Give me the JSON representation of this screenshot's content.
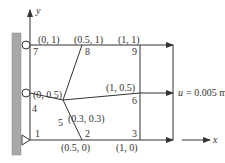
{
  "axes": {
    "y_label": "y",
    "x_label": "x"
  },
  "load": {
    "text": "u = 0.005 m",
    "var": "u",
    "value": "= 0.005 m"
  },
  "nodes": [
    {
      "id": "1",
      "coord": ""
    },
    {
      "id": "2",
      "coord": "(0.5, 0)"
    },
    {
      "id": "3",
      "coord": "(1, 0)"
    },
    {
      "id": "4",
      "coord": "(0, 0.5)"
    },
    {
      "id": "5",
      "coord": "(0.3, 0.3)"
    },
    {
      "id": "6",
      "coord": "(1, 0.5)"
    },
    {
      "id": "7",
      "coord": "(0, 1)"
    },
    {
      "id": "8",
      "coord": "(0.5, 1)"
    },
    {
      "id": "9",
      "coord": "(1, 1)"
    }
  ],
  "colors": {
    "wall": "#a8a8a8",
    "line": "#333333"
  }
}
